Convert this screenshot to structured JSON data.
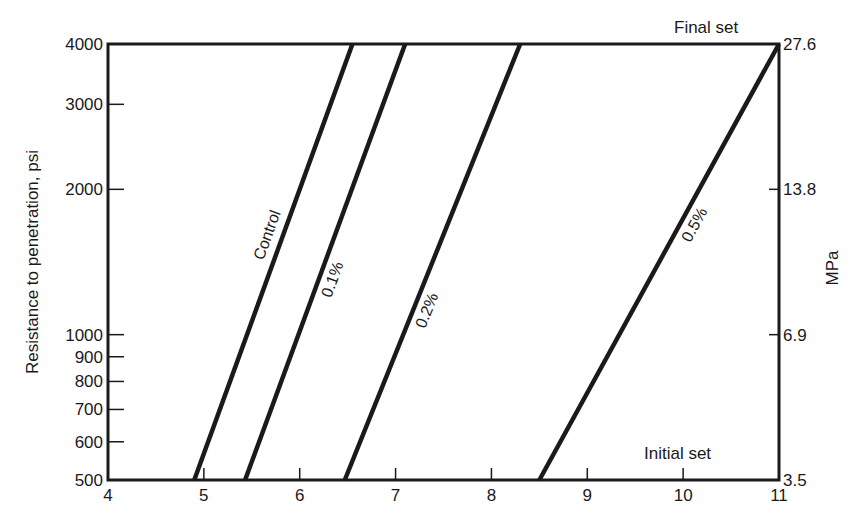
{
  "chart_data": {
    "type": "line",
    "title": "",
    "xlabel": "",
    "ylabel": "Resistance to penetration, psi",
    "ylabel_right": "MPa",
    "x_ticks": [
      "4",
      "5",
      "6",
      "7",
      "8",
      "9",
      "10",
      "11"
    ],
    "y_ticks_left": [
      "500",
      "600",
      "700",
      "800",
      "900",
      "1000",
      "2000",
      "3000",
      "4000"
    ],
    "y_ticks_right": [
      "3.5",
      "6.9",
      "13.8",
      "27.6"
    ],
    "xlim": [
      4,
      11
    ],
    "ylim": [
      500,
      4000
    ],
    "yscale": "log",
    "grid": false,
    "annotations": [
      "Final set",
      "Initial set"
    ],
    "series": [
      {
        "name": "Control",
        "x": [
          4.9,
          6.55
        ],
        "y": [
          500,
          4000
        ]
      },
      {
        "name": "0.1%",
        "x": [
          5.43,
          7.1
        ],
        "y": [
          500,
          4000
        ]
      },
      {
        "name": "0.2%",
        "x": [
          6.47,
          8.3
        ],
        "y": [
          500,
          4000
        ]
      },
      {
        "name": "0.5%",
        "x": [
          8.5,
          11.0
        ],
        "y": [
          500,
          4000
        ]
      }
    ]
  },
  "labels": {
    "ylabel": "Resistance to penetration, psi",
    "ylabel_right": "MPa",
    "final_set": "Final set",
    "initial_set": "Initial set",
    "series": [
      "Control",
      "0.1%",
      "0.2%",
      "0.5%"
    ]
  }
}
